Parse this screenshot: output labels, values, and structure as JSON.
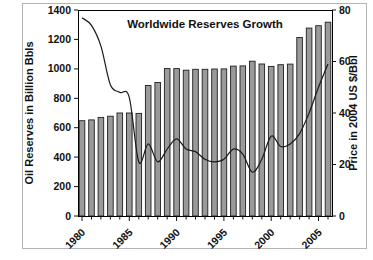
{
  "figure": {
    "title": "Worldwide Reserves Growth"
  },
  "chart_data": {
    "type": "bar",
    "title": "Worldwide Reserves Growth",
    "categories": [
      1980,
      1981,
      1982,
      1983,
      1984,
      1985,
      1986,
      1987,
      1988,
      1989,
      1990,
      1991,
      1992,
      1993,
      1994,
      1995,
      1996,
      1997,
      1998,
      1999,
      2000,
      2001,
      2002,
      2003,
      2004,
      2005,
      2006
    ],
    "series": [
      {
        "name": "Oil Reserves in Billion Bbls",
        "chart_type": "bar",
        "axis": "left",
        "values": [
          648,
          653,
          670,
          678,
          700,
          700,
          697,
          887,
          907,
          1002,
          1002,
          991,
          997,
          997,
          999,
          1000,
          1019,
          1020,
          1052,
          1033,
          1017,
          1028,
          1032,
          1213,
          1277,
          1293,
          1317
        ]
      },
      {
        "name": "Price in 2004 US $/Bbl",
        "chart_type": "line",
        "axis": "right",
        "values": [
          77,
          74,
          66,
          51,
          48,
          46,
          21,
          28,
          21,
          26,
          30,
          26,
          25,
          22,
          21,
          22,
          26,
          24,
          17,
          22,
          31,
          27,
          28,
          32,
          40,
          50,
          59
        ]
      }
    ],
    "left_axis": {
      "label": "Oil Reserves in Billion Bbls",
      "min": 0,
      "max": 1400,
      "tick_step": 200
    },
    "right_axis": {
      "label": "Price in 2004 US $/Bbl",
      "min": 0,
      "max": 80,
      "tick_step": 20
    },
    "x_axis": {
      "tick_label_years": [
        1980,
        1985,
        1990,
        1995,
        2000,
        2005
      ],
      "minor_tick_every_year": true,
      "label_rotation_deg": -45
    },
    "legend": "none",
    "grid": false,
    "colors": {
      "bar_fill": "#9a9a9a",
      "bar_stroke": "#1f1f1f",
      "line": "#1a1a1a",
      "plot_border": "#000000",
      "outer_border": "#b3b3b3",
      "background": "#ffffff"
    }
  }
}
